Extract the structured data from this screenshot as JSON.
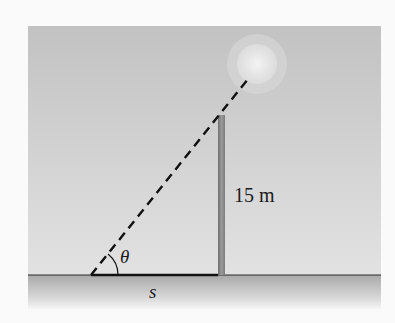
{
  "diagram": {
    "type": "trigonometry-figure",
    "labels": {
      "height": "15 m",
      "angle": "θ",
      "shadow": "s"
    },
    "elements": {
      "sun": "light source (sun)",
      "pole": "vertical pole",
      "ray": "dashed line of sight from shadow tip to sun",
      "ground": "horizontal ground line"
    },
    "colors": {
      "sky": "#c4c4c4",
      "ground": "#b0b0b0",
      "pole": "#8a8a8a",
      "line": "#1a1a1a",
      "sun": "#e6e6e6"
    }
  }
}
